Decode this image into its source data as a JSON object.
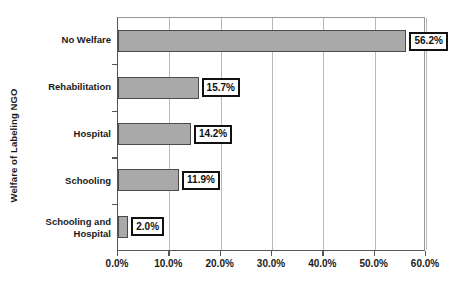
{
  "chart_data": {
    "type": "bar",
    "orientation": "horizontal",
    "title": "",
    "xlabel": "",
    "ylabel": "Welfare of Labeling NGO",
    "categories": [
      "No Welfare",
      "Rehabilitation",
      "Hospital",
      "Schooling",
      "Schooling and Hospital"
    ],
    "values": [
      56.2,
      15.7,
      14.2,
      11.9,
      2.0
    ],
    "data_labels": [
      "56.2%",
      "15.7%",
      "14.2%",
      "11.9%",
      "2.0%"
    ],
    "xlim": [
      0,
      60
    ],
    "xtick_values": [
      0,
      10,
      20,
      30,
      40,
      50,
      60
    ],
    "xtick_labels": [
      "0.0%",
      "10.0%",
      "20.0%",
      "30.0%",
      "40.0%",
      "50.0%",
      "60.0%"
    ],
    "grid": "vertical",
    "legend": "none",
    "bar_color": "#a9a9a9",
    "bar_border_color": "#4a4a4a",
    "label_box_border_color": "#111111",
    "label_box_fill": "#ffffff",
    "gridline_color": "#b9b9b9",
    "axis_color": "#555555",
    "background": "#ffffff"
  },
  "axis": {
    "y_title": "Welfare of Labeling NGO"
  },
  "categories": [
    {
      "label_line1": "No Welfare",
      "label_line2": ""
    },
    {
      "label_line1": "Rehabilitation",
      "label_line2": ""
    },
    {
      "label_line1": "Hospital",
      "label_line2": ""
    },
    {
      "label_line1": "Schooling",
      "label_line2": ""
    },
    {
      "label_line1": "Schooling and",
      "label_line2": "Hospital"
    }
  ],
  "bars": [
    {
      "value_label": "56.2%"
    },
    {
      "value_label": "15.7%"
    },
    {
      "value_label": "14.2%"
    },
    {
      "value_label": "11.9%"
    },
    {
      "value_label": "2.0%"
    }
  ],
  "xticks": [
    {
      "label": "0.0%"
    },
    {
      "label": "10.0%"
    },
    {
      "label": "20.0%"
    },
    {
      "label": "30.0%"
    },
    {
      "label": "40.0%"
    },
    {
      "label": "50.0%"
    },
    {
      "label": "60.0%"
    }
  ]
}
